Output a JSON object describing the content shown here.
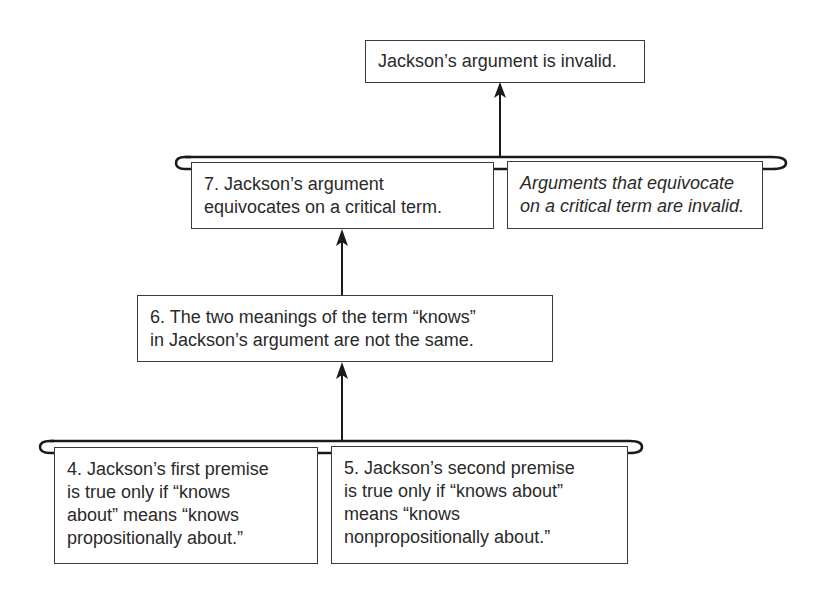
{
  "diagram": {
    "type": "argument-map",
    "conclusion": {
      "text": "Jackson’s argument is invalid."
    },
    "level2": {
      "premise7": {
        "lines": [
          "7. Jackson’s argument",
          "equivocates on a critical term."
        ]
      },
      "hidden_premise": {
        "lines": [
          "Arguments that equivocate",
          "on a critical term are invalid."
        ]
      }
    },
    "level3": {
      "premise6": {
        "lines": [
          "6. The two meanings of the term “knows”",
          "in Jackson’s argument are not the same."
        ]
      }
    },
    "level4": {
      "premise4": {
        "lines": [
          "4. Jackson’s first premise",
          "is true only if “knows",
          "about” means “knows",
          "propositionally about.”"
        ]
      },
      "premise5": {
        "lines": [
          "5. Jackson’s second premise",
          "is true only if “knows about”",
          "means “knows",
          "nonpropositionally about.”"
        ]
      }
    },
    "colors": {
      "stroke": "#1a1a1a",
      "text": "#2a2a2a",
      "background": "#ffffff"
    }
  }
}
